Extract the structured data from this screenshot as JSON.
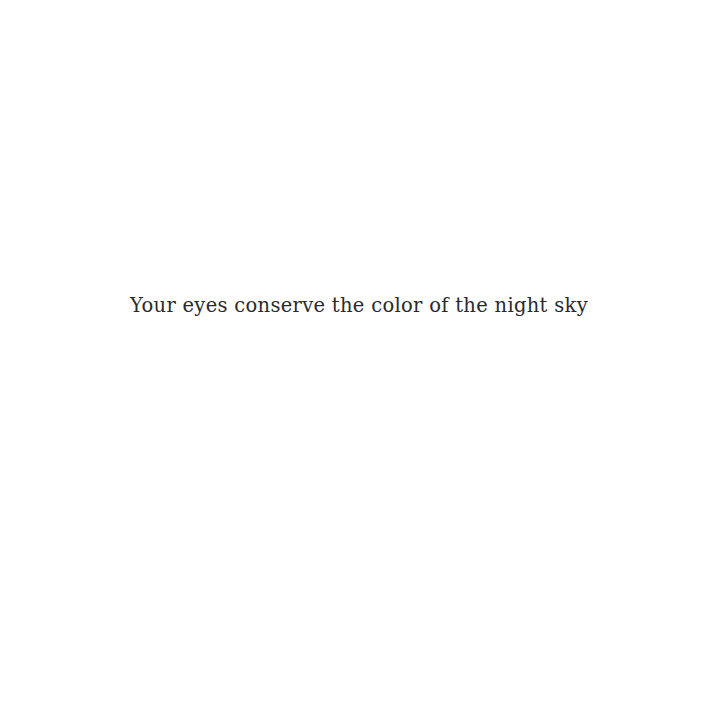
{
  "page": {
    "background_color": "#ffffff",
    "text_color": "#2a2a2a",
    "lines": [
      "Your eyes conserve the color of the night sky"
    ]
  }
}
